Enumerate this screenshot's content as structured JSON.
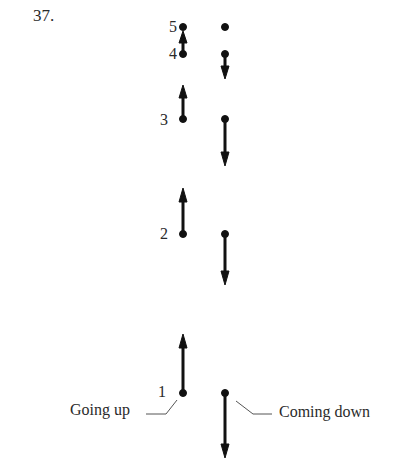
{
  "problem_number": "37.",
  "positions": [
    {
      "label": "5",
      "y": 27
    },
    {
      "label": "4",
      "y": 54
    },
    {
      "label": "3",
      "y": 119
    },
    {
      "label": "2",
      "y": 234
    },
    {
      "label": "1",
      "y": 393
    }
  ],
  "columns": {
    "going_up": {
      "label": "Going up",
      "x": 183
    },
    "coming_down": {
      "label": "Coming down",
      "x": 225
    }
  },
  "going_up_arrows": [
    {
      "from_position": "4",
      "y_start": 54,
      "y_tip": 31
    },
    {
      "from_position": "3",
      "y_start": 119,
      "y_tip": 85
    },
    {
      "from_position": "2",
      "y_start": 234,
      "y_tip": 188
    },
    {
      "from_position": "1",
      "y_start": 393,
      "y_tip": 334
    }
  ],
  "coming_down_arrows": [
    {
      "from_position": "4",
      "y_start": 54,
      "y_tip": 79
    },
    {
      "from_position": "3",
      "y_start": 119,
      "y_tip": 166
    },
    {
      "from_position": "2",
      "y_start": 234,
      "y_tip": 285
    },
    {
      "from_position": "1",
      "y_start": 393,
      "y_tip": 458
    }
  ],
  "colors": {
    "ink": "#111111",
    "text": "#2a2a2a",
    "leader": "#555555"
  }
}
